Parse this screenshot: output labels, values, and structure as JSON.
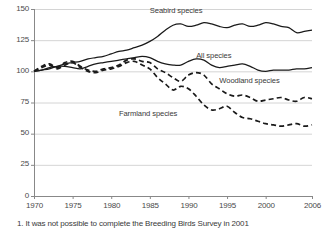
{
  "chart_data": {
    "type": "line",
    "title": "",
    "xlabel": "",
    "ylabel": "",
    "xlim": [
      1970,
      2006
    ],
    "ylim": [
      0,
      150
    ],
    "grid": true,
    "legend_position": "inline-labels",
    "y_ticks": [
      "0",
      "25",
      "50",
      "75",
      "100",
      "125",
      "150"
    ],
    "x_ticks": [
      "1970",
      "1975",
      "1980",
      "1985",
      "1990",
      "1995",
      "2000",
      "2006"
    ],
    "x": [
      1970,
      1971,
      1972,
      1973,
      1974,
      1975,
      1976,
      1977,
      1978,
      1979,
      1980,
      1981,
      1982,
      1983,
      1984,
      1985,
      1986,
      1987,
      1988,
      1989,
      1990,
      1991,
      1992,
      1993,
      1994,
      1995,
      1996,
      1997,
      1998,
      1999,
      2000,
      2001,
      2002,
      2003,
      2004,
      2005,
      2006
    ],
    "series": [
      {
        "name": "Seabird species",
        "style": "solid",
        "color": "#1a1a1a",
        "label_x": 1985,
        "label_y": 148,
        "values": [
          100,
          101,
          103,
          104,
          106,
          107,
          108,
          110,
          111,
          112,
          114,
          116,
          117,
          119,
          121,
          124,
          128,
          133,
          137,
          138,
          136,
          137,
          139,
          138,
          136,
          135,
          137,
          138,
          136,
          137,
          139,
          138,
          136,
          135,
          131,
          132,
          133
        ]
      },
      {
        "name": "All species",
        "style": "solid",
        "color": "#1a1a1a",
        "label_x": 1991,
        "label_y": 112,
        "values": [
          100,
          101,
          102,
          104,
          104,
          103,
          102,
          104,
          106,
          107,
          108,
          109,
          110,
          111,
          112,
          111,
          108,
          106,
          105,
          105,
          108,
          110,
          109,
          105,
          103,
          104,
          105,
          106,
          104,
          101,
          100,
          101,
          101,
          101,
          102,
          102,
          103
        ]
      },
      {
        "name": "Woodland species",
        "style": "dashed",
        "color": "#1a1a1a",
        "label_x": 1994,
        "label_y": 92,
        "values": [
          100,
          104,
          106,
          103,
          107,
          108,
          104,
          101,
          100,
          102,
          103,
          105,
          109,
          110,
          108,
          107,
          102,
          99,
          95,
          92,
          97,
          99,
          97,
          90,
          86,
          82,
          80,
          81,
          79,
          76,
          77,
          78,
          79,
          77,
          76,
          79,
          78
        ]
      },
      {
        "name": "Farmland species",
        "style": "dashed",
        "color": "#1a1a1a",
        "label_x": 1981,
        "label_y": 66,
        "values": [
          100,
          103,
          105,
          102,
          105,
          107,
          103,
          100,
          99,
          101,
          102,
          104,
          107,
          108,
          105,
          102,
          95,
          90,
          85,
          88,
          86,
          80,
          73,
          69,
          70,
          72,
          67,
          63,
          62,
          60,
          58,
          57,
          56,
          57,
          58,
          56,
          57
        ]
      }
    ],
    "footnote": "1. It was not possible to complete the Breeding Birds Survey in 2001"
  }
}
